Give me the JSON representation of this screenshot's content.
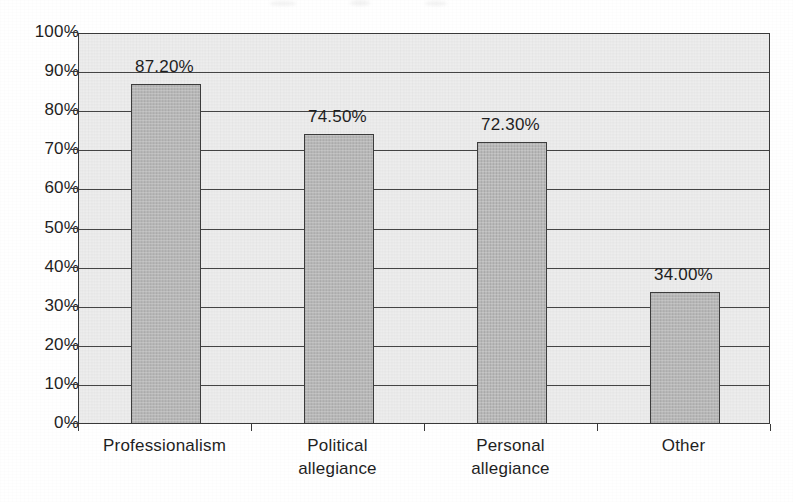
{
  "chart_data": {
    "type": "bar",
    "title": "",
    "subtitle": "",
    "xlabel": "",
    "ylabel": "",
    "categories": [
      "Professionalism",
      "Political allegiance",
      "Personal allegiance",
      "Other"
    ],
    "category_lines": [
      [
        "Professionalism"
      ],
      [
        "Political",
        "allegiance"
      ],
      [
        "Personal",
        "allegiance"
      ],
      [
        "Other"
      ]
    ],
    "values": [
      87.2,
      74.5,
      72.3,
      34.0
    ],
    "data_labels": [
      "87.20%",
      "74.50%",
      "72.30%",
      "34.00%"
    ],
    "ylim": [
      0,
      100
    ],
    "ytick_step": 10,
    "ytick_labels": [
      "100%",
      "90%",
      "80%",
      "70%",
      "60%",
      "50%",
      "40%",
      "30%",
      "20%",
      "10%",
      "0%"
    ],
    "ytick_values": [
      100,
      90,
      80,
      70,
      60,
      50,
      40,
      30,
      20,
      10,
      0
    ],
    "grid": true,
    "grid_axis": "y",
    "legend": false,
    "legend_position": "none",
    "colors": {
      "bar_fill": "#b9b9b9",
      "bar_border": "#3d3d3d",
      "plot_background": "#ededed",
      "grid_line": "#454545",
      "axis_line": "#3a3a3a",
      "text": "#1f1f1f",
      "page_background": "#ffffff"
    }
  }
}
